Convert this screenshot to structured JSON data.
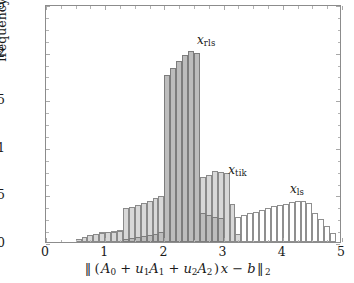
{
  "figure": {
    "type": "histogram-figure",
    "background": "#ffffff"
  },
  "axes": {
    "x": {
      "title_plain": "||(A_0 + u_1 A_1 + u_2 A_2)x - b||_2",
      "ticks": [
        "0",
        "1",
        "2",
        "3",
        "4",
        "5"
      ],
      "tick_values": [
        0,
        1,
        2,
        3,
        4,
        5
      ],
      "range": [
        0,
        5
      ],
      "minor_tick_step": 0.25
    },
    "y": {
      "title": "frequency",
      "ticks": [
        "0",
        "0.05",
        "0.1",
        "0.15",
        "0.2",
        "0.25"
      ],
      "tick_values": [
        0,
        0.05,
        0.1,
        0.15,
        0.2,
        0.25
      ],
      "range": [
        0,
        0.25
      ],
      "minor_tick_step": 0.0125
    }
  },
  "annotations": [
    {
      "name": "x_rls",
      "base": "x",
      "sub": "rls",
      "x": 2.55,
      "y": 0.2125
    },
    {
      "name": "x_tik",
      "base": "x",
      "sub": "tik",
      "x": 3.08,
      "y": 0.0755
    },
    {
      "name": "x_ls",
      "base": "x",
      "sub": "ls",
      "x": 4.12,
      "y": 0.0555
    }
  ],
  "colors": {
    "rls_fill": "#bdbdbd",
    "tik_fill": "#d8d8d8",
    "ls_fill": "#ffffff",
    "edge": "#8a8a8a",
    "axis": "#8c8c8c",
    "text": "#1a1a1a"
  },
  "chart_data": {
    "type": "bar",
    "subtype": "overlapping-histograms",
    "title": "",
    "xlabel": "||(A_0 + u_1 A_1 + u_2 A_2)x - b||_2",
    "ylabel": "frequency",
    "xlim": [
      0,
      5
    ],
    "ylim": [
      0,
      0.25
    ],
    "grid": false,
    "legend": "in-plot annotations",
    "bin_width": 0.1,
    "bin_left_edges": [
      0.0,
      0.1,
      0.2,
      0.3,
      0.4,
      0.5,
      0.6,
      0.7,
      0.8,
      0.9,
      1.0,
      1.1,
      1.2,
      1.3,
      1.4,
      1.5,
      1.6,
      1.7,
      1.8,
      1.9,
      2.0,
      2.1,
      2.2,
      2.3,
      2.4,
      2.5,
      2.6,
      2.7,
      2.8,
      2.9,
      3.0,
      3.1,
      3.2,
      3.3,
      3.4,
      3.5,
      3.6,
      3.7,
      3.8,
      3.9,
      4.0,
      4.1,
      4.2,
      4.3,
      4.4,
      4.5,
      4.6,
      4.7,
      4.8,
      4.9
    ],
    "series": [
      {
        "name": "x_rls",
        "label": "x_rls",
        "color": "#bdbdbd",
        "values": [
          0,
          0,
          0,
          0,
          0,
          0,
          0,
          0,
          0,
          0,
          0,
          0,
          0,
          0.003,
          0.004,
          0.005,
          0.006,
          0.007,
          0.008,
          0.01,
          0.175,
          0.183,
          0.19,
          0.196,
          0.201,
          0.199,
          0.03,
          0.028,
          0.026,
          0.025,
          0,
          0,
          0,
          0,
          0,
          0,
          0,
          0,
          0,
          0,
          0,
          0,
          0,
          0,
          0,
          0,
          0,
          0,
          0,
          0
        ]
      },
      {
        "name": "x_tik",
        "label": "x_tik",
        "color": "#d8d8d8",
        "values": [
          0,
          0,
          0,
          0,
          0,
          0.003,
          0.005,
          0.007,
          0.008,
          0.009,
          0.01,
          0.011,
          0.012,
          0.036,
          0.037,
          0.039,
          0.041,
          0.043,
          0.046,
          0.048,
          0.05,
          0.053,
          0.056,
          0.056,
          0.059,
          0.062,
          0.068,
          0.07,
          0.075,
          0.074,
          0.073,
          0.04,
          0.008,
          0,
          0,
          0,
          0,
          0,
          0,
          0,
          0,
          0,
          0,
          0,
          0,
          0,
          0,
          0,
          0,
          0
        ]
      },
      {
        "name": "x_ls",
        "label": "x_ls",
        "color": "#ffffff",
        "values": [
          0,
          0,
          0,
          0,
          0,
          0.003,
          0.005,
          0.007,
          0.008,
          0.01,
          0.011,
          0.012,
          0.013,
          0.014,
          0.016,
          0.017,
          0.018,
          0.019,
          0.021,
          0.022,
          0.023,
          0.023,
          0.024,
          0.025,
          0.026,
          0.026,
          0.027,
          0.028,
          0.029,
          0.03,
          0.031,
          0.024,
          0.026,
          0.028,
          0.03,
          0.032,
          0.034,
          0.036,
          0.038,
          0.039,
          0.04,
          0.042,
          0.043,
          0.043,
          0.041,
          0.03,
          0.024,
          0.017,
          0.009,
          0
        ]
      }
    ]
  }
}
